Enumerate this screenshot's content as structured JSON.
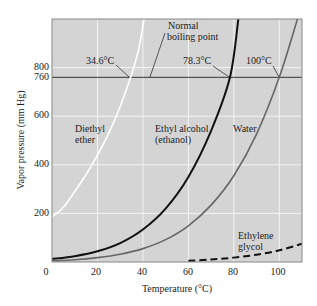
{
  "chart_data": {
    "type": "line",
    "title": "",
    "xlabel": "Temperature (°C)",
    "ylabel": "Vapor pressure (mm Hg)",
    "xlim": [
      0,
      110
    ],
    "ylim": [
      0,
      1000
    ],
    "x_ticks": [
      0,
      20,
      40,
      60,
      80,
      100
    ],
    "y_ticks": [
      200,
      400,
      600,
      760,
      800
    ],
    "grid": true,
    "reference_line": {
      "y": 760,
      "label": "Normal boiling point"
    },
    "series": [
      {
        "name": "Diethyl ether",
        "color": "#ffffff",
        "style": "solid",
        "x": [
          0,
          5,
          10,
          15,
          20,
          25,
          30,
          34.6,
          38,
          40.5
        ],
        "y": [
          185,
          225,
          290,
          360,
          440,
          530,
          640,
          760,
          870,
          1000
        ],
        "boiling_point_label": "34.6°C"
      },
      {
        "name": "Ethyl alcohol (ethanol)",
        "color": "#111111",
        "style": "solid",
        "x": [
          0,
          10,
          20,
          30,
          40,
          50,
          60,
          70,
          78.3,
          82
        ],
        "y": [
          12,
          24,
          44,
          78,
          134,
          220,
          350,
          540,
          760,
          1000
        ],
        "boiling_point_label": "78.3°C"
      },
      {
        "name": "Water",
        "color": "#666666",
        "style": "solid",
        "x": [
          0,
          10,
          20,
          30,
          40,
          50,
          60,
          70,
          80,
          90,
          100,
          108
        ],
        "y": [
          5,
          9,
          18,
          32,
          55,
          92,
          149,
          234,
          355,
          526,
          760,
          1000
        ],
        "boiling_point_label": "100°C"
      },
      {
        "name": "Ethylene glycol",
        "color": "#111111",
        "style": "dashed",
        "x": [
          60,
          70,
          80,
          90,
          100,
          110
        ],
        "y": [
          5,
          10,
          18,
          30,
          48,
          75
        ]
      }
    ]
  },
  "labels": {
    "normal_bp_1": "Normal",
    "normal_bp_2": "boiling point",
    "ether_bp": "34.6°C",
    "ethanol_bp": "78.3°C",
    "water_bp": "100°C",
    "ether_1": "Diethyl",
    "ether_2": "ether",
    "ethanol_1": "Ethyl alcohol",
    "ethanol_2": "(ethanol)",
    "water": "Water",
    "glycol_1": "Ethylene",
    "glycol_2": "glycol"
  },
  "axes": {
    "x_title": "Temperature (°C)",
    "y_title": "Vapor pressure (mm Hg)",
    "x_tick_labels": [
      "0",
      "20",
      "40",
      "60",
      "80",
      "100"
    ],
    "y_tick_labels": [
      "200",
      "400",
      "600",
      "760",
      "800",
      "0"
    ]
  },
  "colors": {
    "plot_bg": "#d4d4d4",
    "grid": "#f4f4f4",
    "frame": "#777777",
    "ref_line": "#333333"
  }
}
